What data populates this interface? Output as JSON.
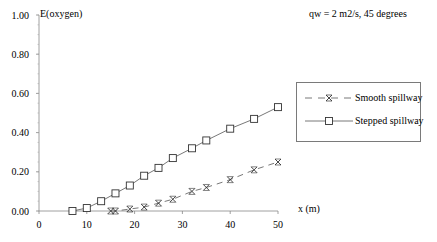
{
  "chart_data": {
    "type": "line",
    "title": "",
    "annotation": "qw = 2 m2/s, 45 degrees",
    "xlabel": "x (m)",
    "ylabel": "E(oxygen)",
    "xlim": [
      0,
      50
    ],
    "ylim": [
      0,
      1.0
    ],
    "xticks": [
      "0",
      "10",
      "20",
      "30",
      "40",
      "50"
    ],
    "yticks": [
      "0.00",
      "0.20",
      "0.40",
      "0.60",
      "0.80",
      "1.00"
    ],
    "grid": false,
    "legend_position": "right",
    "series": [
      {
        "name": "Smooth spillway",
        "marker": "x-star",
        "line": "dashed",
        "x": [
          15,
          16,
          19,
          22,
          25,
          28,
          32,
          35,
          40,
          45,
          50
        ],
        "y": [
          0.0,
          0.0,
          0.01,
          0.02,
          0.04,
          0.06,
          0.1,
          0.12,
          0.16,
          0.21,
          0.25
        ]
      },
      {
        "name": "Stepped spillway",
        "marker": "square",
        "line": "solid",
        "x": [
          7,
          10,
          13,
          16,
          19,
          22,
          25,
          28,
          32,
          35,
          40,
          45,
          50
        ],
        "y": [
          0.0,
          0.015,
          0.05,
          0.09,
          0.13,
          0.18,
          0.22,
          0.27,
          0.32,
          0.36,
          0.42,
          0.47,
          0.53
        ]
      }
    ]
  }
}
